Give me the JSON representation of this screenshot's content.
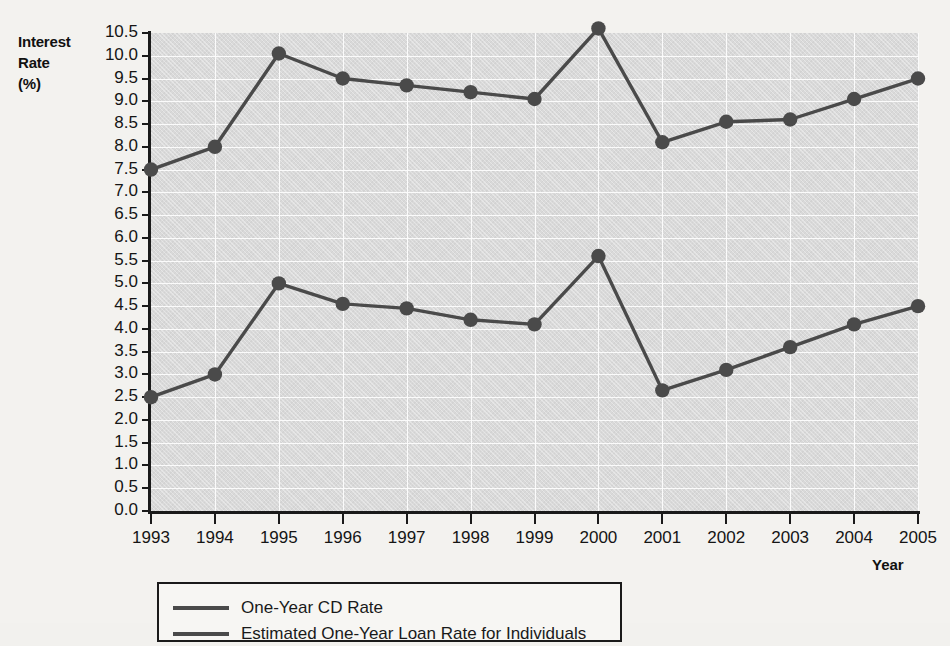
{
  "axes": {
    "y_title_lines": [
      "Interest",
      "Rate",
      "(%)"
    ],
    "x_title": "Year"
  },
  "legend": {
    "items": [
      {
        "label": "One-Year CD Rate",
        "color": "#4a4a4a"
      },
      {
        "label": "Estimated One-Year Loan Rate for Individuals",
        "color": "#4a4a4a"
      }
    ]
  },
  "chart_data": {
    "type": "line",
    "title": "",
    "xlabel": "Year",
    "ylabel": "Interest Rate (%)",
    "categories": [
      "1993",
      "1994",
      "1995",
      "1996",
      "1997",
      "1998",
      "1999",
      "2000",
      "2001",
      "2002",
      "2003",
      "2004",
      "2005"
    ],
    "x": [
      1993,
      1994,
      1995,
      1996,
      1997,
      1998,
      1999,
      2000,
      2001,
      2002,
      2003,
      2004,
      2005
    ],
    "ylim": [
      0.0,
      10.5
    ],
    "xlim": [
      1993,
      2005
    ],
    "ytick_labels": [
      "10.5",
      "10.0",
      "9.5",
      "9.0",
      "8.5",
      "8.0",
      "7.5",
      "7.0",
      "6.5",
      "6.0",
      "5.5",
      "5.0",
      "4.5",
      "4.0",
      "3.5",
      "3.0",
      "2.5",
      "2.0",
      "1.5",
      "1.0",
      "0.5",
      "0.0"
    ],
    "ytick_values": [
      10.5,
      10.0,
      9.5,
      9.0,
      8.5,
      8.0,
      7.5,
      7.0,
      6.5,
      6.0,
      5.5,
      5.0,
      4.5,
      4.0,
      3.5,
      3.0,
      2.5,
      2.0,
      1.5,
      1.0,
      0.5,
      0.0
    ],
    "grid": true,
    "legend_position": "bottom-left",
    "marker": "circle",
    "series": [
      {
        "name": "Estimated One-Year Loan Rate for Individuals",
        "color": "#4a4a4a",
        "values": [
          7.5,
          8.0,
          10.05,
          9.5,
          9.35,
          9.2,
          9.05,
          10.6,
          8.1,
          8.55,
          8.6,
          9.05,
          9.5
        ]
      },
      {
        "name": "One-Year CD Rate",
        "color": "#4a4a4a",
        "values": [
          2.5,
          3.0,
          5.0,
          4.55,
          4.45,
          4.2,
          4.1,
          5.6,
          2.65,
          3.1,
          3.6,
          4.1,
          4.5
        ]
      }
    ]
  }
}
